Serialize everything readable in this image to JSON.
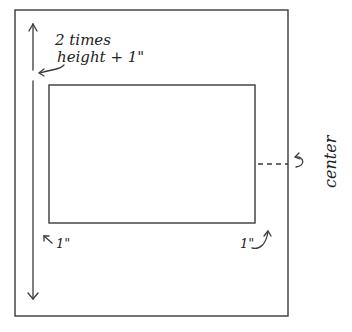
{
  "diagram": {
    "title": "",
    "colors": {
      "ink": "#3a3a3a",
      "text": "#222222",
      "background": "#ffffff"
    },
    "outer_rect": {
      "x": 15,
      "y": 10,
      "w": 273,
      "h": 306
    },
    "inner_rect": {
      "x": 49,
      "y": 85,
      "w": 206,
      "h": 138
    },
    "labels": {
      "height_label_line1": "2 times",
      "height_label_line2": "height + 1\"",
      "bottom_left_margin": "1\"",
      "bottom_right_margin": "1\"",
      "center": "center"
    },
    "annotations": [
      {
        "name": "vertical-dimension-arrow",
        "meaning": "2 times height + 1\""
      },
      {
        "name": "left-margin-callout",
        "meaning": "1\""
      },
      {
        "name": "right-margin-callout",
        "meaning": "1\""
      },
      {
        "name": "center-mark",
        "meaning": "center"
      }
    ]
  }
}
